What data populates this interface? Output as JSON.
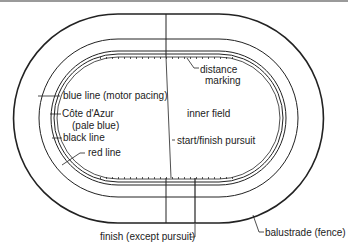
{
  "diagram": {
    "colors": {
      "line": "#222222",
      "background": "#ffffff"
    },
    "labels": {
      "distance_marking_1": "distance",
      "distance_marking_2": "marking",
      "blue_line": "blue line (motor pacing)",
      "cote_dazur_1": "Côte d'Azur",
      "cote_dazur_2": "(pale blue)",
      "black_line": "black line",
      "red_line": "red line",
      "inner_field": "inner field",
      "start_finish_pursuit": "start/finish pursuit",
      "finish_except_pursuit": "finish (except pursuit)",
      "balustrade": "balustrade (fence)"
    }
  }
}
